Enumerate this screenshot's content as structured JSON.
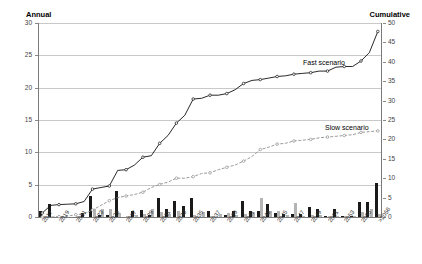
{
  "chart_data": {
    "type": "bar",
    "title": "",
    "subtitle": "",
    "ylabel": "Annual",
    "ylabel_right": "Cumulative",
    "xlabel": "",
    "grid": true,
    "legend_position": "inline-annotations",
    "ylim": [
      0,
      30
    ],
    "ylim_right": [
      0,
      50
    ],
    "yticks": [
      0,
      5,
      10,
      15,
      20,
      25,
      30
    ],
    "yticks_right": [
      0,
      5,
      10,
      15,
      20,
      25,
      30,
      35,
      40,
      45,
      50
    ],
    "categories": [
      "2017",
      "2018",
      "2019",
      "2020",
      "2021",
      "2022",
      "2023",
      "2024",
      "2025",
      "2026",
      "2027",
      "2028",
      "2029",
      "2030",
      "2031",
      "2032",
      "2033",
      "2034",
      "2035",
      "2036",
      "2037",
      "2038",
      "2039",
      "2040",
      "2041",
      "2042",
      "2043",
      "2044",
      "2045",
      "2046",
      "2047",
      "2048",
      "2049",
      "2050",
      "2051",
      "2052",
      "2053",
      "2054",
      "2055",
      "2056",
      ">2056"
    ],
    "xtick_labels": [
      "2017",
      "2019",
      "2021",
      "2023",
      "2025",
      "2027",
      "2029",
      "2031",
      "2033",
      "2035",
      "2037",
      "2039",
      "2041",
      "2043",
      "2045",
      "2047",
      "2049",
      "2051",
      "2053",
      "2055",
      ">2056"
    ],
    "annotations": [
      {
        "text": "Fast scenario",
        "x": 2033,
        "y": 22
      },
      {
        "text": "Slow scenario",
        "x": 2045,
        "y": 13
      }
    ],
    "series": [
      {
        "name": "Fast scenario annual",
        "type": "bar",
        "color": "#1a1a1a",
        "axis": "left",
        "values": [
          1.0,
          2.0,
          0.0,
          0.0,
          0.0,
          0.7,
          3.2,
          0.3,
          0.3,
          4.0,
          0.0,
          1.0,
          1.1,
          0.3,
          3.0,
          1.3,
          2.5,
          1.7,
          3.0,
          0.0,
          0.9,
          0.0,
          0.3,
          1.0,
          2.5,
          1.0,
          1.0,
          2.0,
          0.6,
          0.5,
          0.5,
          0.4,
          1.5,
          1.3,
          0.2,
          1.2,
          0.2,
          0.1,
          2.3,
          2.3,
          5.3
        ]
      },
      {
        "name": "Slow scenario annual",
        "type": "bar",
        "color": "#b4b4b4",
        "axis": "left",
        "values": [
          0.0,
          0.0,
          0.0,
          0.0,
          0.2,
          0.0,
          1.2,
          1.2,
          1.2,
          0.6,
          0.2,
          0.3,
          0.5,
          1.3,
          0.8,
          0.5,
          1.0,
          0.0,
          0.3,
          0.8,
          0.2,
          0.5,
          0.6,
          0.3,
          0.5,
          0.6,
          3.0,
          0.9,
          1.0,
          0.3,
          2.2,
          0.2,
          0.3,
          0.3,
          0.1,
          0.2,
          0.2,
          0.1,
          0.8,
          1.2,
          0.4
        ]
      },
      {
        "name": "Fast scenario",
        "type": "line",
        "color": "#111111",
        "axis": "right",
        "values": [
          1.0,
          3.0,
          3.2,
          3.3,
          3.4,
          4.0,
          7.2,
          7.6,
          8.0,
          12.0,
          12.2,
          13.4,
          15.4,
          15.8,
          19.0,
          21.0,
          24.2,
          26.2,
          30.4,
          30.6,
          31.4,
          31.4,
          31.8,
          32.8,
          34.4,
          35.2,
          35.4,
          35.8,
          36.2,
          36.4,
          36.8,
          37.0,
          37.2,
          37.6,
          37.6,
          38.6,
          38.8,
          38.8,
          40.2,
          42.4,
          47.8
        ]
      },
      {
        "name": "Slow scenario",
        "type": "line",
        "color": "#8e8e8e",
        "axis": "right",
        "values": [
          0.0,
          0.0,
          0.1,
          0.2,
          0.6,
          0.8,
          1.8,
          3.0,
          4.2,
          5.0,
          5.4,
          5.8,
          6.4,
          7.6,
          8.4,
          9.0,
          10.0,
          10.0,
          10.4,
          11.2,
          11.4,
          12.2,
          12.8,
          13.4,
          14.4,
          15.6,
          17.4,
          18.0,
          18.8,
          19.0,
          19.6,
          19.8,
          20.0,
          20.4,
          20.6,
          20.8,
          21.0,
          21.2,
          21.8,
          22.0,
          22.2
        ]
      }
    ]
  }
}
